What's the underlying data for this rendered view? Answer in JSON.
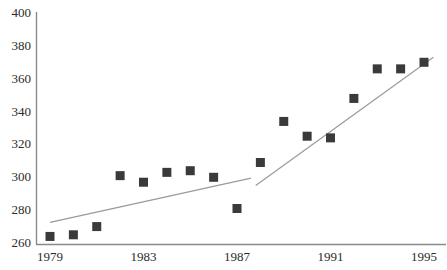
{
  "chart_data": {
    "type": "scatter",
    "title": "",
    "subtitle": "",
    "xlabel": "",
    "ylabel": "",
    "xlim": [
      1978.4,
      1996.0
    ],
    "ylim": [
      260,
      400
    ],
    "xticks": [
      1979,
      1983,
      1987,
      1991,
      1995
    ],
    "xtick_labels": [
      "1979",
      "1983",
      "1987",
      "1991",
      "1995"
    ],
    "yticks": [
      260,
      280,
      300,
      320,
      340,
      360,
      380,
      400
    ],
    "ytick_labels": [
      "260",
      "280",
      "300",
      "320",
      "340",
      "360",
      "380",
      "400"
    ],
    "grid": false,
    "legend": null,
    "legend_position": "none",
    "marker": "square",
    "marker_color": "#3a3a3a",
    "marker_size_px": 9,
    "axis_color": "#8a8a8a",
    "trend_color": "#9a9a9a",
    "x": [
      1979,
      1980,
      1981,
      1982,
      1983,
      1984,
      1985,
      1986,
      1987,
      1988,
      1989,
      1990,
      1991,
      1992,
      1993,
      1994,
      1995
    ],
    "values": [
      264,
      265,
      270,
      301,
      297,
      303,
      304,
      300,
      281,
      309,
      334,
      325,
      324,
      348,
      366,
      366,
      370
    ],
    "series": [
      {
        "name": "observations",
        "x": [
          1979,
          1980,
          1981,
          1982,
          1983,
          1984,
          1985,
          1986,
          1987,
          1988,
          1989,
          1990,
          1991,
          1992,
          1993,
          1994,
          1995
        ],
        "values": [
          264,
          265,
          270,
          301,
          297,
          303,
          304,
          300,
          281,
          309,
          334,
          325,
          324,
          348,
          366,
          366,
          370
        ]
      }
    ],
    "trend_lines": [
      {
        "name": "segment-1",
        "x_start": 1979.0,
        "y_start": 272.5,
        "x_end": 1987.6,
        "y_end": 299.5
      },
      {
        "name": "segment-2",
        "x_start": 1987.8,
        "y_start": 295.0,
        "x_end": 1995.4,
        "y_end": 373.0
      }
    ]
  }
}
